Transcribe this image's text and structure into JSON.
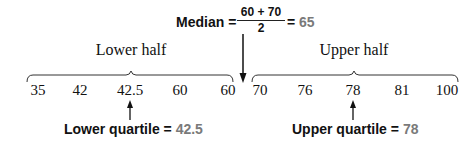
{
  "median": {
    "label": "Median",
    "equals": "=",
    "numerator": "60 + 70",
    "denominator": "2",
    "result_equals": "=",
    "result": "65"
  },
  "halves": {
    "lower_label": "Lower half",
    "upper_label": "Upper half"
  },
  "data_values": {
    "lower": [
      "35",
      "42",
      "42.5",
      "60",
      "60"
    ],
    "upper": [
      "70",
      "76",
      "78",
      "81",
      "100"
    ]
  },
  "quartiles": {
    "lower_label": "Lower quartile",
    "lower_equals": "=",
    "lower_value": "42.5",
    "upper_label": "Upper quartile",
    "upper_equals": "=",
    "upper_value": "78"
  },
  "colors": {
    "text": "#111111",
    "result_gray": "#7a7a7a",
    "line": "#222222"
  },
  "icons": {
    "median_arrow": "arrow-down-icon",
    "lower_quartile_arrow": "arrow-up-icon",
    "upper_quartile_arrow": "arrow-up-icon",
    "lower_brace": "brace-icon",
    "upper_brace": "brace-icon"
  }
}
